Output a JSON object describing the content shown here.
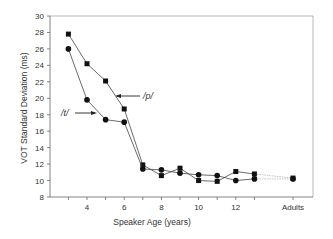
{
  "chart_data": {
    "type": "line",
    "title": "",
    "xlabel": "Speaker Age  (years)",
    "ylabel": "VOT Standard Deviation  (ms)",
    "ylim": [
      8,
      30
    ],
    "yticks": [
      8,
      10,
      12,
      14,
      16,
      18,
      20,
      22,
      24,
      26,
      28,
      30
    ],
    "xtick_labels": [
      {
        "x": 4,
        "label": "4"
      },
      {
        "x": 6,
        "label": "6"
      },
      {
        "x": 8,
        "label": "8"
      },
      {
        "x": 10,
        "label": "10"
      },
      {
        "x": 12,
        "label": "12"
      },
      {
        "x": 17,
        "label": "Adults"
      }
    ],
    "x": [
      3,
      4,
      5,
      6,
      7,
      8,
      9,
      10,
      11,
      12,
      13,
      "Adults"
    ],
    "grid": false,
    "legend": "none (inline arrow annotations)",
    "series": [
      {
        "name": "/p/",
        "marker": "square",
        "values": [
          27.8,
          24.2,
          22.1,
          18.7,
          11.9,
          10.6,
          11.5,
          10.0,
          9.9,
          11.1,
          10.8,
          10.3
        ]
      },
      {
        "name": "/t/",
        "marker": "circle",
        "values": [
          26.0,
          19.8,
          17.4,
          17.1,
          11.4,
          11.3,
          10.9,
          10.7,
          10.6,
          10.0,
          10.2,
          10.2
        ]
      }
    ],
    "annotations": [
      {
        "text": "/p/",
        "points_to": "/p/ series near age 6"
      },
      {
        "text": "/t/",
        "points_to": "/t/ series near age 4-5"
      }
    ]
  }
}
